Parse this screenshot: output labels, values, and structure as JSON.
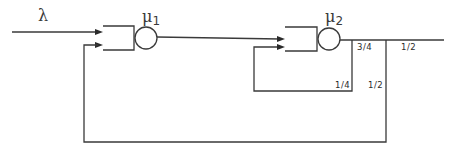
{
  "diagram": {
    "type": "queueing-network",
    "arrival": {
      "label": "λ"
    },
    "stations": [
      {
        "id": "station-1",
        "rate_symbol": "μ",
        "rate_subscript": "1"
      },
      {
        "id": "station-2",
        "rate_symbol": "μ",
        "rate_subscript": "2"
      }
    ],
    "routing": {
      "after_station_2_continue": "3/4",
      "after_station_2_feedback_self": "1/4",
      "exit": "1/2",
      "feedback_to_station_1": "1/2"
    },
    "edges": [
      {
        "from": "source",
        "to": "station-1",
        "label": "λ"
      },
      {
        "from": "station-1",
        "to": "station-2",
        "label": ""
      },
      {
        "from": "station-2",
        "to": "station-2",
        "label": "1/4"
      },
      {
        "from": "station-2",
        "to": "split",
        "label": "3/4"
      },
      {
        "from": "split",
        "to": "sink",
        "label": "1/2"
      },
      {
        "from": "split",
        "to": "station-1",
        "label": "1/2"
      }
    ]
  }
}
